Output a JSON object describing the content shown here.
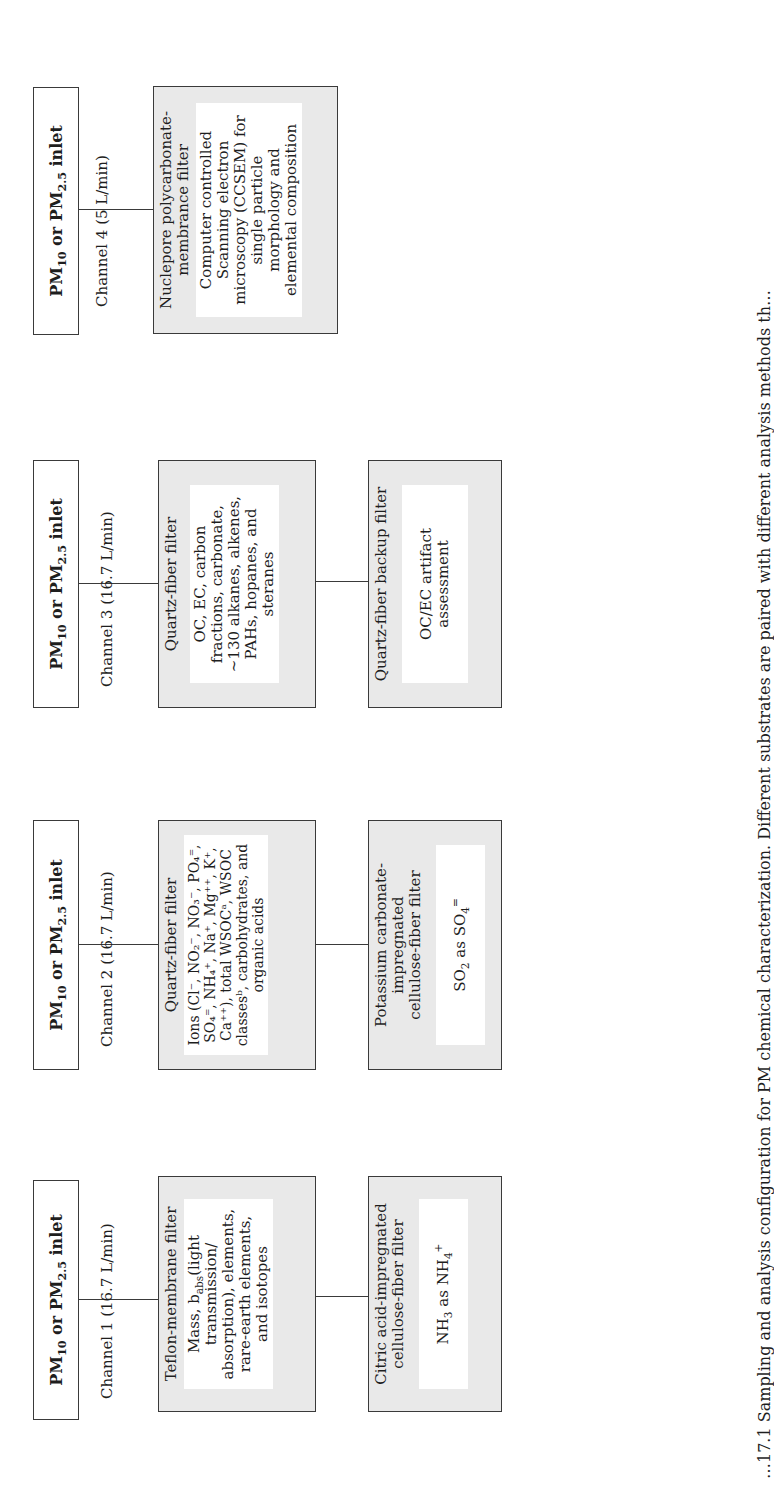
{
  "diagram": {
    "orientation": "rotated -90deg (landscape figure on portrait page)",
    "channels": [
      {
        "id": 1,
        "inlet": {
          "pre": "PM",
          "sub1": "10",
          "mid": " or PM",
          "sub2": "2.5",
          "post": " inlet"
        },
        "label": "Channel 1 (16.7 L/min)",
        "filter": {
          "title": "Teflon-membrane filter",
          "analysis_parts": {
            "a": "Mass, b",
            "sub": "abs",
            "b": "(light transmission/ absorption), elements, rare-earth elements, and isotopes"
          }
        },
        "backup": {
          "title": "Citric acid-impregnated cellulose-fiber filter",
          "analysis_parts": {
            "a": "NH",
            "sub": "3",
            "b": " as NH",
            "sub2": "4",
            "sup2": "+"
          }
        }
      },
      {
        "id": 2,
        "inlet": {
          "pre": "PM",
          "sub1": "10",
          "mid": " or PM",
          "sub2": "2.5",
          "post": " inlet"
        },
        "label": "Channel 2 (16.7 L/min)",
        "filter": {
          "title": "Quartz-fiber filter",
          "analysis": "Ions (Cl⁻, NO₂⁻, NO₃⁻, PO₄⁼, SO₄⁼, NH₄⁺, Na⁺, Mg⁺⁺, K⁺, Ca⁺⁺), total WSOCᵃ, WSOC classesᵇ, carbohydrates, and organic acids"
        },
        "backup": {
          "title": "Potassium carbonate-impregnated cellulose-fiber filter",
          "analysis_parts": {
            "a": "SO",
            "sub": "2",
            "b": " as SO",
            "sub2": "4",
            "sup2": "="
          }
        }
      },
      {
        "id": 3,
        "inlet": {
          "pre": "PM",
          "sub1": "10",
          "mid": " or PM",
          "sub2": "2.5",
          "post": " inlet"
        },
        "label": "Channel 3 (16.7 L/min)",
        "filter": {
          "title": "Quartz-fiber filter",
          "analysis": "OC, EC, carbon fractions, carbonate, ~130 alkanes, alkenes, PAHs, hopanes, and steranes"
        },
        "backup": {
          "title": "Quartz-fiber backup filter",
          "analysis": "OC/EC artifact assessment"
        }
      },
      {
        "id": 4,
        "inlet": {
          "pre": "PM",
          "sub1": "10",
          "mid": " or PM",
          "sub2": "2.5",
          "post": " inlet"
        },
        "label": "Channel 4 (5 L/min)",
        "filter": {
          "title": "Nuclepore polycarbonate-membrance filter",
          "analysis": "Computer controlled Scanning electron microscopy (CCSEM) for single particle morphology and elemental composition"
        }
      }
    ],
    "caption": "…17.1 Sampling and analysis configuration for PM chemical characterization. Different substrates are paired with different analysis methods th…"
  },
  "colors": {
    "border": "#3a3a3a",
    "filter_fill": "#e9e9e9",
    "inner_fill": "#ffffff",
    "text": "#1e1e1e"
  }
}
